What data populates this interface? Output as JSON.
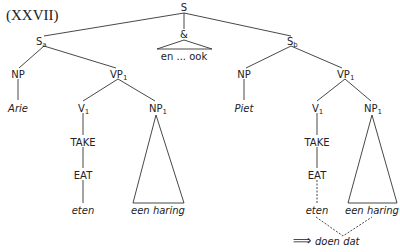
{
  "example_number": "(XXVII)",
  "tree": {
    "root": "S",
    "conjunction": {
      "label": "&",
      "leaf": "en ... ook"
    },
    "left_clause": {
      "label": "S",
      "sub": "a",
      "subject": {
        "label": "NP",
        "leaf": "Arie"
      },
      "vp": {
        "label": "VP",
        "sub": "1",
        "verb": {
          "label": "V",
          "sub": "1",
          "chain": [
            "TAKE",
            "EAT"
          ],
          "leaf": "eten"
        },
        "object": {
          "label": "NP",
          "sub": "1",
          "leaf": "een haring"
        }
      }
    },
    "right_clause": {
      "label": "S",
      "sub": "b",
      "subject": {
        "label": "NP",
        "leaf": "Piet"
      },
      "vp": {
        "label": "VP",
        "sub": "1",
        "verb": {
          "label": "V",
          "sub": "1",
          "chain": [
            "TAKE",
            "EAT"
          ],
          "leaf": "eten"
        },
        "object": {
          "label": "NP",
          "sub": "1",
          "leaf": "een haring"
        }
      }
    },
    "replacement": {
      "arrow": "⟹",
      "text": "doen dat"
    }
  }
}
